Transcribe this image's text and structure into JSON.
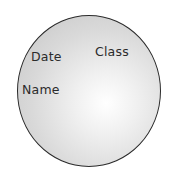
{
  "diagram": {
    "shape": "circle",
    "labels": {
      "date": "Date",
      "class": "Class",
      "name": "Name"
    },
    "colors": {
      "outline": "#2a2a2a",
      "fill_center": "#ffffff",
      "fill_edge": "#c4c4c4",
      "text": "#2b2b2b"
    }
  }
}
